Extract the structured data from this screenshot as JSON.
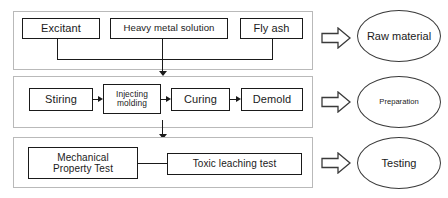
{
  "diagram": {
    "colors": {
      "node_border": "#1a1a1a",
      "stage_border": "#b9b9b9",
      "connector": "#1a1a1a",
      "background": "#ffffff"
    }
  },
  "stages": [
    {
      "id": "raw-material",
      "stage_label": "Raw material",
      "arrow_icon": "block-arrow-right-icon",
      "nodes": [
        {
          "id": "excitant",
          "label": "Excitant"
        },
        {
          "id": "heavy-metal-solution",
          "label": "Heavy metal solution"
        },
        {
          "id": "fly-ash",
          "label": "Fly ash"
        }
      ]
    },
    {
      "id": "preparation",
      "stage_label": "Preparation",
      "arrow_icon": "block-arrow-right-icon",
      "nodes": [
        {
          "id": "stiring",
          "label": "Stiring"
        },
        {
          "id": "injecting-molding",
          "label_line1": "Injecting",
          "label_line2": "molding"
        },
        {
          "id": "curing",
          "label": "Curing"
        },
        {
          "id": "demold",
          "label": "Demold"
        }
      ]
    },
    {
      "id": "testing",
      "stage_label": "Testing",
      "arrow_icon": "block-arrow-right-icon",
      "nodes": [
        {
          "id": "mechanical-property-test",
          "label_line1": "Mechanical",
          "label_line2": "Property Test"
        },
        {
          "id": "toxic-leaching-test",
          "label": "Toxic leaching test"
        }
      ]
    }
  ]
}
